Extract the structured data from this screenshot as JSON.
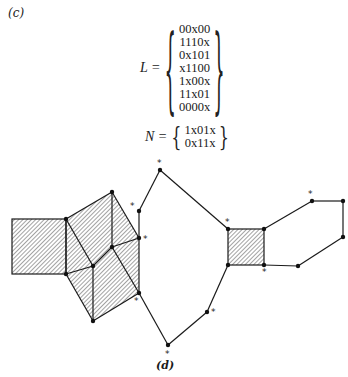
{
  "labels": {
    "part_c": "(c)",
    "part_d": "(d)"
  },
  "equation_L": {
    "lhs": "L =",
    "rows": [
      "00x00",
      "1110x",
      "0x101",
      "x1100",
      "1x00x",
      "11x01",
      "0000x"
    ],
    "brace_open": "{",
    "brace_close": "}"
  },
  "equation_N": {
    "lhs": "N =",
    "rows": [
      "1x01x",
      "0x11x"
    ],
    "brace_open": "{",
    "brace_close": "}"
  },
  "graph": {
    "star_symbol": "*",
    "colors": {
      "line": "#1a1a1a",
      "hatch": "#555555"
    }
  }
}
